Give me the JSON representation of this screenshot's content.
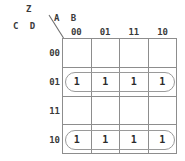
{
  "diagram": {
    "type": "karnaugh-map",
    "output_variable": "Z",
    "row_variables": "C D",
    "column_variables": "A B",
    "column_headers": [
      "00",
      "01",
      "11",
      "10"
    ],
    "row_headers": [
      "00",
      "01",
      "11",
      "10"
    ],
    "cells": [
      [
        "",
        "",
        "",
        ""
      ],
      [
        "1",
        "1",
        "1",
        "1"
      ],
      [
        "",
        "",
        "",
        ""
      ],
      [
        "1",
        "1",
        "1",
        "1"
      ]
    ],
    "groups": [
      {
        "name": "group-row-01",
        "row": 1,
        "col_start": 0,
        "col_span": 4
      },
      {
        "name": "group-row-10",
        "row": 3,
        "col_start": 0,
        "col_span": 4
      }
    ],
    "colors": {
      "grid_line": "#8d8d8d",
      "group_outline": "#9a9a9a",
      "text": "#3a3a3a",
      "cell_text": "#2b2b2b",
      "background": "#ffffff"
    }
  }
}
